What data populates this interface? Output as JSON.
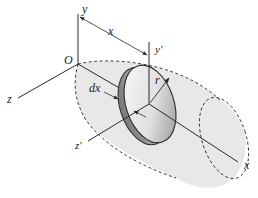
{
  "diagram": {
    "title": "",
    "labels": {
      "y": "y",
      "x_dim": "x",
      "origin": "O",
      "y_prime": "y'",
      "r": "r",
      "z": "z",
      "dx": "dx",
      "z_prime": "z'",
      "x_axis": "x"
    },
    "colors": {
      "line": "#2a2a2a",
      "shaded_region": "#e6e6e6",
      "disc_face_light": "#f4f4f4",
      "disc_face_dark": "#9a9a9a",
      "background": "#ffffff"
    }
  }
}
